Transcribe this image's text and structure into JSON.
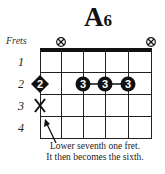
{
  "chord": {
    "name": "A",
    "suffix": "6"
  },
  "labels": {
    "frets": "Frets",
    "fret_numbers": [
      "1",
      "2",
      "3",
      "4"
    ]
  },
  "muted_strings_above_nut": [
    2,
    6
  ],
  "fingers": [
    {
      "string": 1,
      "fret": 2,
      "finger": "2",
      "shape": "diamond"
    },
    {
      "string": 3,
      "fret": 2,
      "finger": "3",
      "shape": "circle"
    },
    {
      "string": 4,
      "fret": 2,
      "finger": "3",
      "shape": "circle"
    },
    {
      "string": 5,
      "fret": 2,
      "finger": "3",
      "shape": "circle"
    }
  ],
  "removed_note": {
    "string": 1,
    "fret": 3,
    "symbol": "X"
  },
  "annotation": {
    "line1": "Lower seventh one fret.",
    "line2": "It then becomes the sixth."
  }
}
